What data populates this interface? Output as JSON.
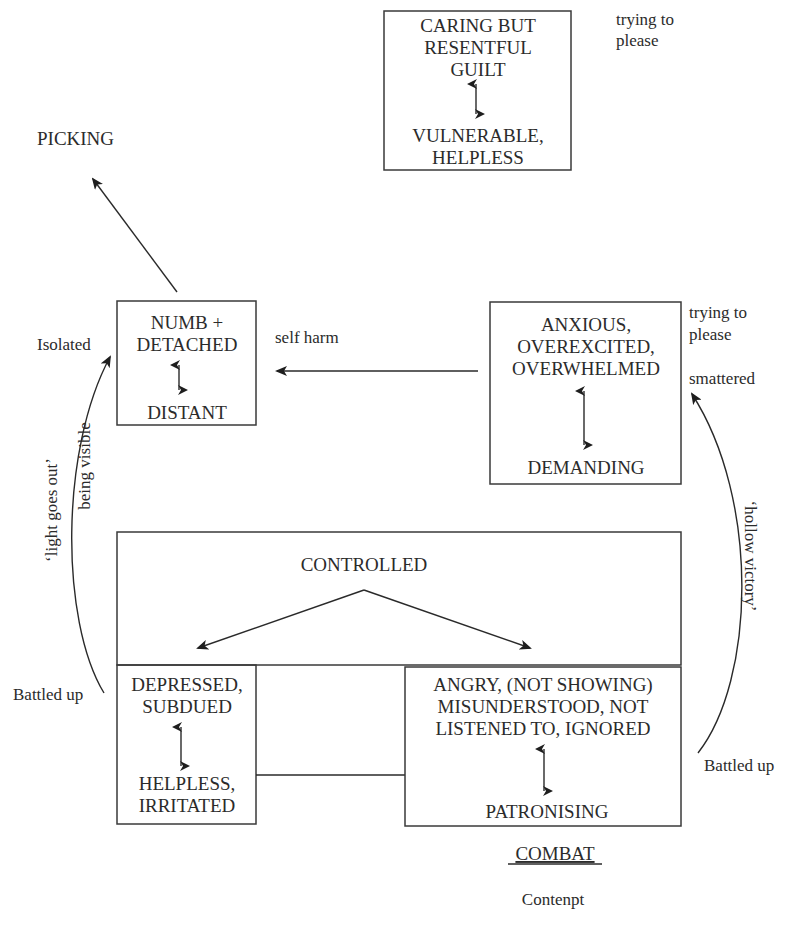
{
  "boxes": {
    "guilt": {
      "lines": [
        "CARING BUT",
        "RESENTFUL",
        "GUILT"
      ],
      "bottom": [
        "VULNERABLE,",
        "HELPLESS"
      ],
      "note": [
        "trying to",
        "please"
      ]
    },
    "numb": {
      "lines": [
        "NUMB +",
        "DETACHED"
      ],
      "bottom": [
        "DISTANT"
      ]
    },
    "anxious": {
      "lines": [
        "ANXIOUS,",
        "OVEREXCITED,",
        "OVERWHELMED"
      ],
      "bottom": [
        "DEMANDING"
      ],
      "note": [
        "trying to",
        "please"
      ],
      "note2": "smattered"
    },
    "controlled": {
      "label": "CONTROLLED"
    },
    "depressed": {
      "lines": [
        "DEPRESSED,",
        "SUBDUED"
      ],
      "bottom": [
        "HELPLESS,",
        "IRRITATED"
      ]
    },
    "angry": {
      "lines": [
        "ANGRY, (NOT SHOWING)",
        "MISUNDERSTOOD, NOT",
        "LISTENED TO, IGNORED"
      ],
      "bottom": [
        "PATRONISING"
      ]
    }
  },
  "labels": {
    "picking": "PICKING",
    "isolated": "Isolated",
    "self_harm": "self harm",
    "light_goes_out": "‘light goes out’",
    "being_visible": "being visible",
    "battled_up_left": "Battled up",
    "battled_up_right": "Battled up",
    "hollow_victory": "‘hollow victory’",
    "combat": "COMBAT",
    "contempt": "Contenpt"
  },
  "colors": {
    "ink": "#2b2b2b",
    "background": "#ffffff"
  }
}
